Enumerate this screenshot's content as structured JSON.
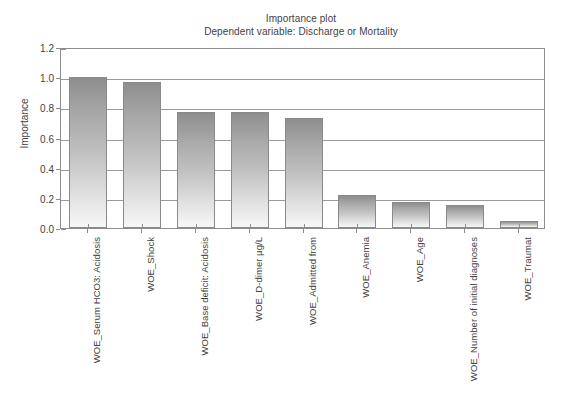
{
  "chart_data": {
    "type": "bar",
    "title": "Importance plot",
    "subtitle": "Dependent variable: Discharge or Mortality",
    "xlabel": "",
    "ylabel": "Importance",
    "ylim": [
      0.0,
      1.2
    ],
    "yticks": [
      "0.0",
      "0.2",
      "0.4",
      "0.6",
      "0.8",
      "1.0",
      "1.2"
    ],
    "ytick_values": [
      0.0,
      0.2,
      0.4,
      0.6,
      0.8,
      1.0,
      1.2
    ],
    "grid": true,
    "legend": "none",
    "categories": [
      "WOE_Serum HCO3: Acidosis",
      "WOE_Shock",
      "WOE_Base deficit: Acidosis",
      "WOE_D-dimer µg/L",
      "WOE_Admitted from",
      "WOE_Anemia",
      "WOE_Age",
      "WOE_Number of initial diagnoses",
      "WOE_Traumat"
    ],
    "values": [
      1.0,
      0.97,
      0.77,
      0.77,
      0.73,
      0.22,
      0.175,
      0.15,
      0.045
    ],
    "bar_color_top": "#8e8e8e",
    "bar_color_bottom": "#f7f7f7",
    "bar_border_color": "#8a8a8a",
    "axis_color": "#8d8d8d",
    "text_color": "#3f3f3f",
    "background": "#ffffff"
  }
}
